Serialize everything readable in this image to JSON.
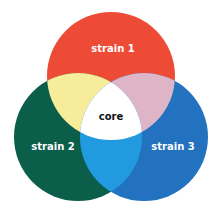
{
  "diagram": {
    "type": "venn",
    "sets": [
      {
        "id": "strain1",
        "label": "strain 1",
        "color": "#EE4B36",
        "label_color": "#ffffff"
      },
      {
        "id": "strain2",
        "label": "strain 2",
        "color": "#0B5E4A",
        "label_color": "#ffffff"
      },
      {
        "id": "strain3",
        "label": "strain 3",
        "color": "#2272BF",
        "label_color": "#ffffff"
      }
    ],
    "overlaps": [
      {
        "sets": [
          "strain1",
          "strain2"
        ],
        "color": "#F6EC9A"
      },
      {
        "sets": [
          "strain1",
          "strain3"
        ],
        "color": "#DDB5C6"
      },
      {
        "sets": [
          "strain2",
          "strain3"
        ],
        "color": "#229AE0"
      },
      {
        "sets": [
          "strain1",
          "strain2",
          "strain3"
        ],
        "color": "#FFFFFF",
        "label": "core",
        "label_color": "#111111"
      }
    ]
  },
  "labels": {
    "strain1": "strain 1",
    "strain2": "strain 2",
    "strain3": "strain 3",
    "core": "core"
  }
}
